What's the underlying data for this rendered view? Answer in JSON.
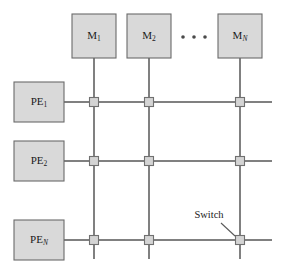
{
  "figure": {
    "colors": {
      "box_fill": "#d9d9d9",
      "box_stroke": "#6b6b6b",
      "line": "#808080",
      "switch_fill": "#d4d4d4",
      "switch_stroke": "#707070",
      "text": "#1a1a1a",
      "background": "#ffffff"
    }
  },
  "memory_modules": [
    {
      "name": "memory-module-1",
      "base": "M",
      "subscript": "1",
      "subscript_italic": false,
      "x": 94,
      "y": 36,
      "box_x": 72,
      "box_y": 14,
      "box_w": 44,
      "box_h": 44,
      "column_x": 94
    },
    {
      "name": "memory-module-2",
      "base": "M",
      "subscript": "2",
      "subscript_italic": false,
      "x": 149,
      "y": 36,
      "box_x": 127,
      "box_y": 14,
      "box_w": 44,
      "box_h": 44,
      "column_x": 149
    },
    {
      "name": "memory-module-n",
      "base": "M",
      "subscript": "N",
      "subscript_italic": true,
      "x": 240,
      "y": 36,
      "box_x": 218,
      "box_y": 14,
      "box_w": 44,
      "box_h": 44,
      "column_x": 240
    }
  ],
  "processing_elements": [
    {
      "name": "processing-element-1",
      "base": "PE",
      "subscript": "1",
      "subscript_italic": false,
      "x": 39,
      "y": 102,
      "box_x": 14,
      "box_y": 82,
      "box_w": 50,
      "box_h": 40,
      "row_y": 102
    },
    {
      "name": "processing-element-2",
      "base": "PE",
      "subscript": "2",
      "subscript_italic": false,
      "x": 39,
      "y": 161,
      "box_x": 14,
      "box_y": 141,
      "box_w": 50,
      "box_h": 40,
      "row_y": 161
    },
    {
      "name": "processing-element-n",
      "base": "PE",
      "subscript": "N",
      "subscript_italic": true,
      "x": 39,
      "y": 240,
      "box_x": 14,
      "box_y": 220,
      "box_w": 50,
      "box_h": 40,
      "row_y": 240
    }
  ],
  "ellipsis": {
    "name": "memory-ellipsis",
    "dots": [
      {
        "cx": 183,
        "cy": 37
      },
      {
        "cx": 194,
        "cy": 37
      },
      {
        "cx": 205,
        "cy": 37
      }
    ],
    "radius": 1.8
  },
  "grid": {
    "column_x": [
      94,
      149,
      240
    ],
    "row_y": [
      102,
      161,
      240
    ],
    "row_line_x_start": 64,
    "row_line_x_end": 272,
    "column_line_y_start": 58,
    "column_line_y_end": 259,
    "switch_size": 9
  },
  "switches": [
    {
      "name": "switch-r1-c1",
      "x": 94,
      "y": 102
    },
    {
      "name": "switch-r1-c2",
      "x": 149,
      "y": 102
    },
    {
      "name": "switch-r1-c3",
      "x": 240,
      "y": 102
    },
    {
      "name": "switch-r2-c1",
      "x": 94,
      "y": 161
    },
    {
      "name": "switch-r2-c2",
      "x": 149,
      "y": 161
    },
    {
      "name": "switch-r2-c3",
      "x": 240,
      "y": 161
    },
    {
      "name": "switch-r3-c1",
      "x": 94,
      "y": 240
    },
    {
      "name": "switch-r3-c2",
      "x": 149,
      "y": 240
    },
    {
      "name": "switch-r3-c3",
      "x": 240,
      "y": 240
    }
  ],
  "annotation": {
    "label": "Switch",
    "label_x": 209,
    "label_y": 216,
    "leader_x1": 221,
    "leader_y1": 223,
    "leader_x2": 235,
    "leader_y2": 236
  }
}
